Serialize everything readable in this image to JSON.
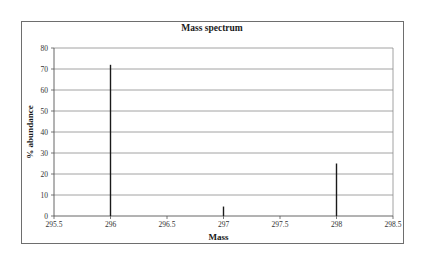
{
  "chart_data": {
    "type": "bar",
    "subtype": "stick-spectrum",
    "title": "Mass spectrum",
    "xlabel": "Mass",
    "ylabel": "% abundance",
    "xlim": [
      295.5,
      298.5
    ],
    "ylim": [
      0,
      80
    ],
    "x_ticks": [
      "295.5",
      "296",
      "296.5",
      "297",
      "297.5",
      "298",
      "298.5"
    ],
    "y_ticks": [
      "0",
      "10",
      "20",
      "30",
      "40",
      "50",
      "60",
      "70",
      "80"
    ],
    "grid": "horizontal",
    "legend": "none",
    "x": [
      296,
      297,
      298
    ],
    "values": [
      72,
      4.5,
      25
    ],
    "colors": {
      "bars": "#1a1a1a",
      "grid": "#8a8a8a",
      "frame": "#6e6e6e"
    }
  }
}
